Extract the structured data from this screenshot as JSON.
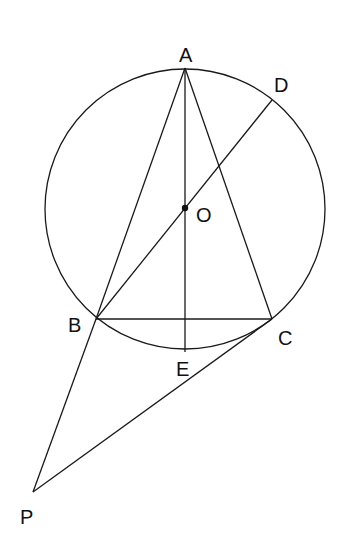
{
  "diagram": {
    "type": "geometry",
    "circle": {
      "center_label": "O",
      "cx": 185,
      "cy": 209,
      "r": 140
    },
    "points": {
      "A": {
        "label": "A",
        "x": 185,
        "y": 68,
        "lx": 179,
        "ly": 62
      },
      "B": {
        "label": "B",
        "x": 96,
        "y": 319,
        "lx": 68,
        "ly": 332
      },
      "C": {
        "label": "C",
        "x": 272,
        "y": 319,
        "lx": 278,
        "ly": 345
      },
      "D": {
        "label": "D",
        "x": 272,
        "y": 100,
        "lx": 274,
        "ly": 92
      },
      "E": {
        "label": "E",
        "x": 185,
        "y": 352,
        "lx": 176,
        "ly": 376
      },
      "O": {
        "label": "O",
        "x": 185,
        "y": 208,
        "lx": 196,
        "ly": 222
      },
      "P": {
        "label": "P",
        "x": 33,
        "y": 492,
        "lx": 20,
        "ly": 524
      }
    },
    "segments": [
      "AB",
      "AC",
      "AE",
      "BC",
      "BD",
      "BP",
      "PC"
    ]
  }
}
